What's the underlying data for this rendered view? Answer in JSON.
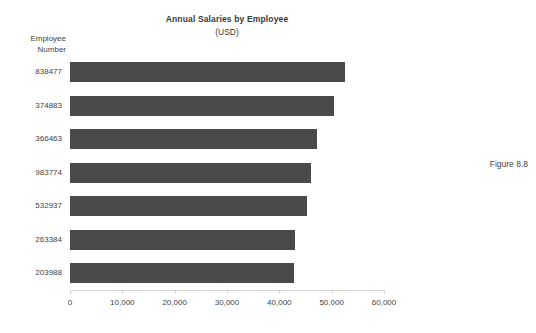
{
  "figure": {
    "caption": "Figure 8.8"
  },
  "chart_data": {
    "type": "bar",
    "orientation": "horizontal",
    "title": "Annual Salaries by Employee",
    "subtitle": "(USD)",
    "xlabel": "",
    "ylabel": "Employee Number",
    "ylabel_lines": [
      "Employee",
      "Number"
    ],
    "categories": [
      "838477",
      "374883",
      "366463",
      "983774",
      "532937",
      "263384",
      "203988"
    ],
    "values": [
      52500,
      50500,
      47200,
      46000,
      45200,
      43000,
      42800
    ],
    "xlim": [
      0,
      60000
    ],
    "xticks": [
      0,
      10000,
      20000,
      30000,
      40000,
      50000,
      60000
    ],
    "xtick_labels": [
      "0",
      "10,000",
      "20,000",
      "30,000",
      "40,000",
      "50,000",
      "60,000"
    ],
    "grid": false,
    "legend": null,
    "bar_color": "#4a4a4a",
    "axis_color": "#d4d4d4",
    "background": "#ffffff"
  }
}
